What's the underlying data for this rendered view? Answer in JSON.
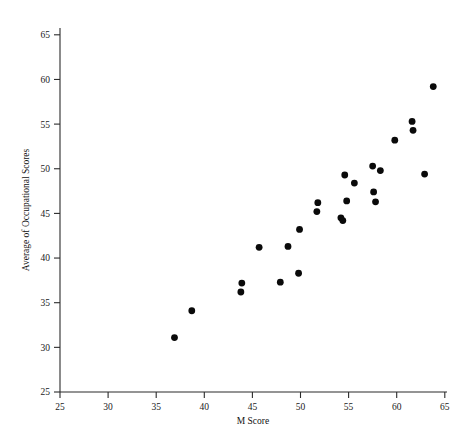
{
  "chart_data": {
    "type": "scatter",
    "title": "",
    "xlabel": "M Score",
    "ylabel": "Average of Occupational Scores",
    "xlim": [
      25,
      67
    ],
    "ylim": [
      25,
      66.5
    ],
    "xticks": [
      25,
      30,
      35,
      40,
      45,
      50,
      55,
      60,
      65
    ],
    "yticks": [
      25,
      30,
      35,
      40,
      45,
      50,
      55,
      60,
      65
    ],
    "grid": false,
    "legend": "none",
    "marker": "filled-circle",
    "marker_color": "#0a0a0a",
    "points": [
      {
        "x": 36.9,
        "y": 31.1
      },
      {
        "x": 38.7,
        "y": 34.1
      },
      {
        "x": 43.8,
        "y": 36.2
      },
      {
        "x": 43.9,
        "y": 37.2
      },
      {
        "x": 45.7,
        "y": 41.2
      },
      {
        "x": 47.9,
        "y": 37.3
      },
      {
        "x": 48.7,
        "y": 41.3
      },
      {
        "x": 49.8,
        "y": 38.3
      },
      {
        "x": 49.9,
        "y": 43.2
      },
      {
        "x": 51.7,
        "y": 45.2
      },
      {
        "x": 51.8,
        "y": 46.2
      },
      {
        "x": 54.2,
        "y": 44.5
      },
      {
        "x": 54.4,
        "y": 44.2
      },
      {
        "x": 54.6,
        "y": 49.3
      },
      {
        "x": 54.8,
        "y": 46.4
      },
      {
        "x": 55.6,
        "y": 48.4
      },
      {
        "x": 57.5,
        "y": 50.3
      },
      {
        "x": 57.6,
        "y": 47.4
      },
      {
        "x": 57.8,
        "y": 46.3
      },
      {
        "x": 58.3,
        "y": 49.8
      },
      {
        "x": 59.8,
        "y": 53.2
      },
      {
        "x": 61.6,
        "y": 55.3
      },
      {
        "x": 61.7,
        "y": 54.3
      },
      {
        "x": 62.9,
        "y": 49.4
      },
      {
        "x": 63.8,
        "y": 59.2
      }
    ]
  },
  "axes": {
    "x_tick_labels": [
      "25",
      "30",
      "35",
      "40",
      "45",
      "50",
      "55",
      "60",
      "65"
    ],
    "y_tick_labels": [
      "25",
      "30",
      "35",
      "40",
      "45",
      "50",
      "55",
      "60",
      "65"
    ],
    "x_axis_title": "M Score",
    "y_axis_title": "Average of Occupational Scores"
  }
}
